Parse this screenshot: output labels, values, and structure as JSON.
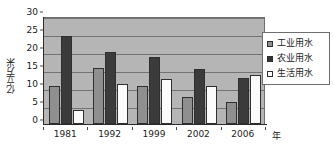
{
  "chart_data": {
    "type": "bar",
    "title": "",
    "xlabel": "年",
    "ylabel": "亿立方米",
    "categories": [
      "1981",
      "1992",
      "1999",
      "2002",
      "2006"
    ],
    "series": [
      {
        "name": "工业用水",
        "values": [
          10.5,
          15.5,
          10.5,
          7.5,
          6.0
        ],
        "color": "#8f8f8f"
      },
      {
        "name": "农业用水",
        "values": [
          24.5,
          20.0,
          18.5,
          15.2,
          12.8
        ],
        "color": "#333333"
      },
      {
        "name": "生活用水",
        "values": [
          4.0,
          11.0,
          12.5,
          10.6,
          13.5
        ],
        "color": "#ffffff"
      }
    ],
    "ylim": [
      0,
      30
    ],
    "yticks": [
      0,
      5,
      10,
      15,
      20,
      25,
      30
    ],
    "ytick_labels": [
      "0",
      "5",
      "10",
      "15",
      "20",
      "25",
      "30"
    ],
    "grid": true,
    "legend_position": "right",
    "plot_background": "#b5b5b5"
  },
  "legend": {
    "items": [
      {
        "label": "工业用水"
      },
      {
        "label": "农业用水"
      },
      {
        "label": "生活用水"
      }
    ]
  },
  "axes": {
    "y_title": "亿立方米",
    "x_unit": "年"
  }
}
